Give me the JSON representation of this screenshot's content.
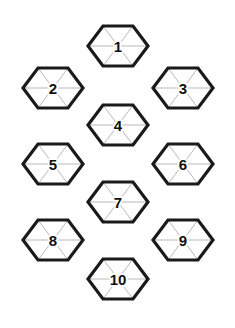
{
  "board": {
    "title": "Hexagon Puzzle Grid",
    "width": 235,
    "height": 328,
    "background_color": "#ffffff",
    "outline_color": "#1a1a1a",
    "inner_line_color": "#b9b9b9",
    "label_color": "#111111",
    "hex_half_width": 30,
    "hex_half_height": 40,
    "outline_stroke_width": 3.2,
    "inner_stroke_width": 1,
    "triangles_per_hex": 6,
    "hex_orientation": "flat-top-pointy-side"
  },
  "cells": [
    {
      "label": "1",
      "cx": 118,
      "cy": 46,
      "column": "middle",
      "row": 0
    },
    {
      "label": "2",
      "cx": 53,
      "cy": 88,
      "column": "left",
      "row": 1
    },
    {
      "label": "3",
      "cx": 183,
      "cy": 88,
      "column": "right",
      "row": 1
    },
    {
      "label": "4",
      "cx": 118,
      "cy": 125,
      "column": "middle",
      "row": 2
    },
    {
      "label": "5",
      "cx": 53,
      "cy": 164,
      "column": "left",
      "row": 3
    },
    {
      "label": "6",
      "cx": 183,
      "cy": 164,
      "column": "right",
      "row": 3
    },
    {
      "label": "7",
      "cx": 118,
      "cy": 202,
      "column": "middle",
      "row": 4
    },
    {
      "label": "8",
      "cx": 53,
      "cy": 240,
      "column": "left",
      "row": 5
    },
    {
      "label": "9",
      "cx": 183,
      "cy": 240,
      "column": "right",
      "row": 5
    },
    {
      "label": "10",
      "cx": 118,
      "cy": 279,
      "column": "middle",
      "row": 6
    }
  ]
}
